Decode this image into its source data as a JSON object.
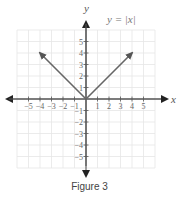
{
  "chart_data": {
    "type": "line",
    "title": "",
    "function_label": "y = |x|",
    "xlabel": "x",
    "ylabel": "y",
    "xlim": [
      -6,
      6
    ],
    "ylim": [
      -6,
      6
    ],
    "grid": true,
    "x_ticks": [
      -5,
      -4,
      -3,
      -2,
      -1,
      1,
      2,
      3,
      4,
      5
    ],
    "y_ticks": [
      -5,
      -4,
      -3,
      -2,
      -1,
      1,
      2,
      3,
      4,
      5
    ],
    "x_tick_labels": [
      "−5",
      "−4",
      "−3",
      "−2",
      "−1",
      "1",
      "2",
      "3",
      "4",
      "5"
    ],
    "y_tick_labels": [
      "−5",
      "−4",
      "−3",
      "−2",
      "−1",
      "1",
      "2",
      "3",
      "4",
      "5"
    ],
    "series": [
      {
        "name": "y = |x|",
        "x": [
          -4,
          0,
          4
        ],
        "y": [
          4,
          0,
          4
        ],
        "arrows": "both-ends",
        "color": "#666666"
      }
    ]
  },
  "caption": "Figure 3"
}
